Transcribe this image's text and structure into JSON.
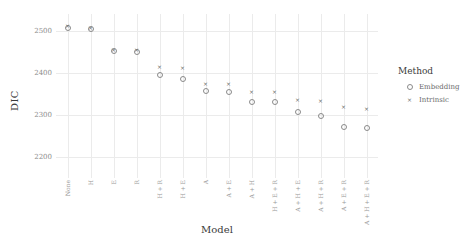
{
  "chart_data": {
    "type": "scatter",
    "title": "",
    "xlabel": "Model",
    "ylabel": "DIC",
    "ylim": [
      2150,
      2540
    ],
    "yticks": [
      2500,
      2400,
      2300,
      2200
    ],
    "ytick_labels": [
      "2500",
      "2400",
      "2300",
      "2200"
    ],
    "grid": true,
    "legend_position": "right",
    "legend_title": "Method",
    "categories": [
      "None",
      "H",
      "E",
      "R",
      "H + R",
      "H + E",
      "A",
      "A + E",
      "A + H",
      "H + E + R",
      "A + H + E",
      "A + H + R",
      "A + E + R",
      "A + H + E + R"
    ],
    "series": [
      {
        "name": "Embedding",
        "marker": "circle-open",
        "color": "#8a8a8a",
        "values": [
          2508,
          2505,
          2452,
          2450,
          2396,
          2386,
          2358,
          2355,
          2332,
          2330,
          2306,
          2298,
          2272,
          2268
        ]
      },
      {
        "name": "Intrinsic",
        "marker": "cross",
        "color": "#6e6e6e",
        "values": [
          2512,
          2507,
          2456,
          2455,
          2416,
          2412,
          2374,
          2374,
          2356,
          2356,
          2336,
          2334,
          2320,
          2316
        ]
      }
    ],
    "legend_entries": [
      {
        "label": "Embedding",
        "marker": "circle-open"
      },
      {
        "label": "Intrinsic",
        "marker": "cross"
      }
    ],
    "marker_glyphs": {
      "circle-open": "",
      "cross": "×"
    }
  }
}
